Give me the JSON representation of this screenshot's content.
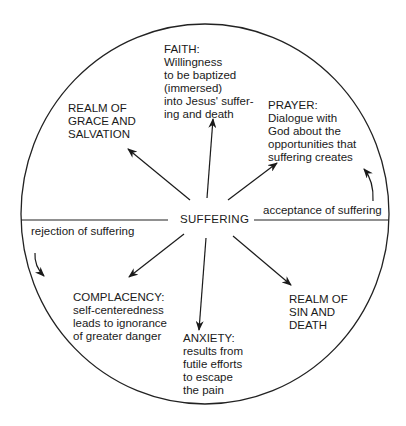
{
  "diagram": {
    "title": "",
    "center_label": "SUFFERING",
    "circle": {
      "cx": 205,
      "cy": 214,
      "r": 187,
      "stroke": "#222222"
    },
    "divider_labels": {
      "left": "rejection of suffering",
      "right": "acceptance of suffering"
    },
    "nodes": {
      "faith": {
        "heading": "FAITH:",
        "lines": [
          "Willingness",
          "to be baptized",
          "(immersed)",
          "into Jesus' suffer-",
          "ing and death"
        ]
      },
      "grace": {
        "heading": "REALM OF",
        "lines": [
          "GRACE AND",
          "SALVATION"
        ]
      },
      "prayer": {
        "heading": "PRAYER:",
        "lines": [
          "Dialogue with",
          "God about the",
          "opportunities that",
          "suffering creates"
        ]
      },
      "complacency": {
        "heading": "COMPLACENCY:",
        "lines": [
          "self-centeredness",
          "leads to ignorance",
          "of greater danger"
        ]
      },
      "anxiety": {
        "heading": "ANXIETY:",
        "lines": [
          "results from",
          "futile efforts",
          "to escape",
          "the pain"
        ]
      },
      "sin": {
        "heading": "REALM OF",
        "lines": [
          "SIN AND",
          "DEATH"
        ]
      }
    },
    "edges": [
      {
        "from": "SUFFERING",
        "to": "REALM OF GRACE AND SALVATION"
      },
      {
        "from": "SUFFERING",
        "to": "FAITH"
      },
      {
        "from": "SUFFERING",
        "to": "PRAYER"
      },
      {
        "from": "SUFFERING",
        "to": "COMPLACENCY"
      },
      {
        "from": "SUFFERING",
        "to": "ANXIETY"
      },
      {
        "from": "SUFFERING",
        "to": "REALM OF SIN AND DEATH"
      },
      {
        "from": "rejection of suffering",
        "to": "lower half (curved arrow)"
      },
      {
        "from": "acceptance of suffering",
        "to": "upper half (curved arrow)"
      }
    ]
  }
}
